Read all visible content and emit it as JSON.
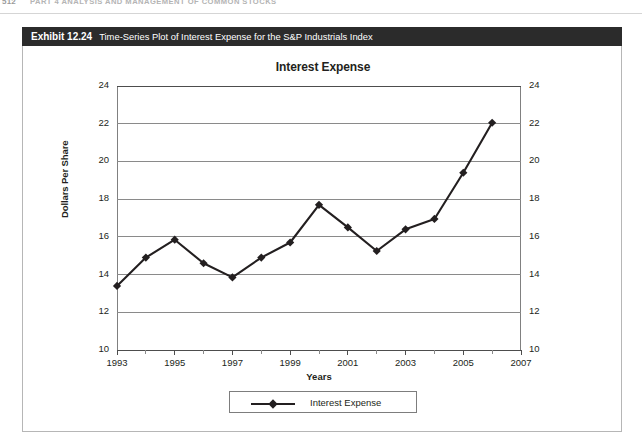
{
  "page": {
    "folio": "512",
    "running_head": "PART 4  ANALYSIS AND MANAGEMENT OF COMMON STOCKS"
  },
  "exhibit": {
    "number": "Exhibit 12.24",
    "caption": "Time-Series Plot of Interest Expense for the S&P Industrials Index"
  },
  "chart_data": {
    "type": "line",
    "title": "Interest Expense",
    "xlabel": "Years",
    "ylabel": "Dollars Per Share",
    "x": [
      1993,
      1994,
      1995,
      1996,
      1997,
      1998,
      1999,
      2000,
      2001,
      2002,
      2003,
      2004,
      2005,
      2006
    ],
    "values": [
      13.4,
      14.9,
      15.85,
      14.6,
      13.85,
      14.9,
      15.7,
      17.7,
      16.5,
      15.25,
      16.4,
      16.95,
      19.4,
      22.05
    ],
    "series": [
      {
        "name": "Interest Expense",
        "values": [
          13.4,
          14.9,
          15.85,
          14.6,
          13.85,
          14.9,
          15.7,
          17.7,
          16.5,
          15.25,
          16.4,
          16.95,
          19.4,
          22.05
        ]
      }
    ],
    "ylim": [
      10,
      24
    ],
    "ytick_step": 2,
    "yticks": [
      10,
      12,
      14,
      16,
      18,
      20,
      22,
      24
    ],
    "ytick_labels": [
      "10",
      "12",
      "14",
      "16",
      "18",
      "20",
      "22",
      "24"
    ],
    "y_axis_right": true,
    "ytick_labels_right": [
      "10",
      "12",
      "14",
      "16",
      "18",
      "20",
      "22",
      "24"
    ],
    "xlim": [
      1993,
      2007
    ],
    "xticks": [
      1993,
      1994,
      1995,
      1996,
      1997,
      1998,
      1999,
      2000,
      2001,
      2002,
      2003,
      2004,
      2005,
      2006,
      2007
    ],
    "xtick_labels_shown": [
      "1993",
      "1995",
      "1997",
      "1999",
      "2001",
      "2003",
      "2005",
      "2007"
    ],
    "grid": true,
    "grid_axis": "y",
    "legend": [
      "Interest Expense"
    ],
    "legend_position": "bottom-center",
    "marker": "diamond",
    "line_color": "#231f20",
    "grid_color": "#8a8a8a"
  }
}
